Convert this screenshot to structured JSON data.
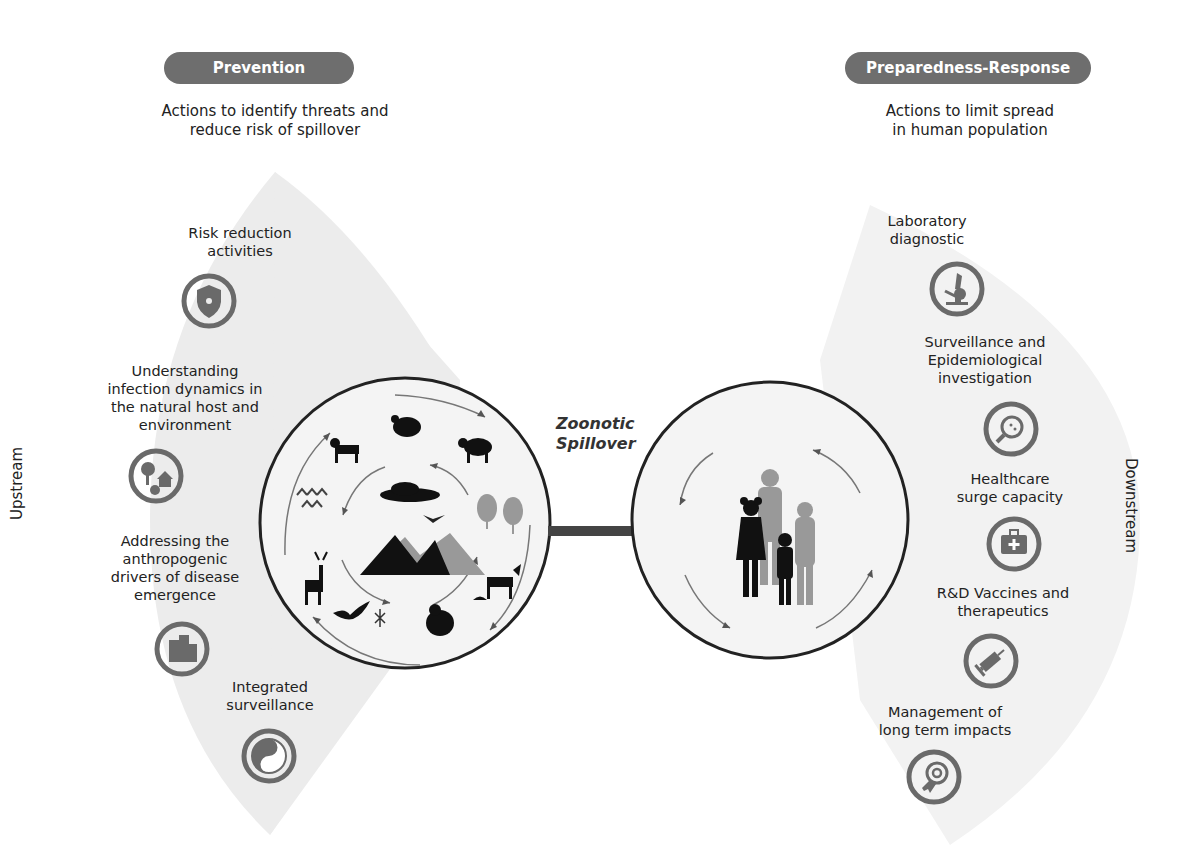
{
  "prevention": {
    "pill_label": "Prevention",
    "subtitle_line1": "Actions to identify threats and",
    "subtitle_line2": "reduce risk of spillover",
    "side_label": "Upstream",
    "items": [
      {
        "lines": [
          "Risk reduction",
          "activities"
        ],
        "icon": "shield-icon"
      },
      {
        "lines": [
          "Understanding",
          "infection dynamics in",
          "the natural host and",
          "environment"
        ],
        "icon": "tree-house-icon"
      },
      {
        "lines": [
          "Addressing the",
          "anthropogenic",
          "drivers of disease",
          "emergence"
        ],
        "icon": "buildings-icon"
      },
      {
        "lines": [
          "Integrated",
          "surveillance"
        ],
        "icon": "yin-yang-icon"
      }
    ]
  },
  "response": {
    "pill_label": "Preparedness-Response",
    "subtitle_line1": "Actions to limit spread",
    "subtitle_line2": "in human population",
    "side_label": "Downstream",
    "items": [
      {
        "lines": [
          "Laboratory",
          "diagnostic"
        ],
        "icon": "microscope-icon"
      },
      {
        "lines": [
          "Surveillance and",
          "Epidemiological",
          "investigation"
        ],
        "icon": "magnifier-cell-icon"
      },
      {
        "lines": [
          "Healthcare",
          "surge capacity"
        ],
        "icon": "medical-kit-icon"
      },
      {
        "lines": [
          "R&D Vaccines and",
          "therapeutics"
        ],
        "icon": "syringe-icon"
      },
      {
        "lines": [
          "Management of",
          "long term impacts"
        ],
        "icon": "target-ribbon-icon"
      }
    ]
  },
  "center": {
    "spillover_line1": "Zoonotic",
    "spillover_line2": "Spillover",
    "animal_circle_icons": [
      "turkey-icon",
      "sheep-icon",
      "trees-icon",
      "goat-icon",
      "shell-icon",
      "gorilla-icon",
      "mosquito-icon",
      "bat-icon",
      "deer-icon",
      "plants-icon",
      "dog-icon",
      "cloud-icon",
      "bird-icon",
      "mountains-icon"
    ],
    "human_circle_icons": [
      "family-silhouette-icon"
    ]
  },
  "colors": {
    "pill": "#6e6e6e",
    "fan_bg": "#ececec",
    "icon_gray": "#6a6a6a",
    "circle_stroke": "#222222",
    "arrow": "#555555"
  }
}
